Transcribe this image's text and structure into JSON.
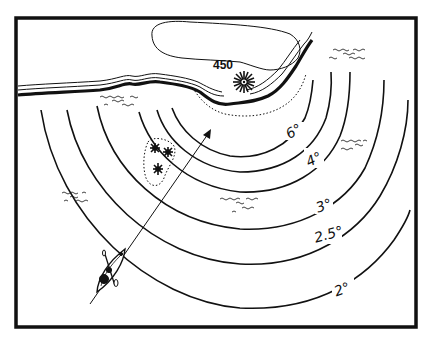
{
  "diagram": {
    "type": "navigation chart illustration",
    "landmark": {
      "name": "lighthouse",
      "elevation_label": "450",
      "icon": "lighthouse-star-icon"
    },
    "arcs": [
      {
        "label": "6°"
      },
      {
        "label": "4°"
      },
      {
        "label": "3°"
      },
      {
        "label": "2.5°"
      },
      {
        "label": "2°"
      }
    ],
    "hazards": {
      "name": "rocks",
      "count": 3,
      "icon": "rock-asterisk-icon"
    },
    "vessel": {
      "name": "kayak",
      "icon": "kayak-icon"
    },
    "bearing_arrow": {
      "direction": "toward lighthouse"
    },
    "water_marks": 5,
    "colors": {
      "ink": "#111111",
      "paper": "#ffffff"
    }
  }
}
